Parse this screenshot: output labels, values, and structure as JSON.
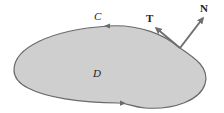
{
  "diagram": {
    "type": "region-with-boundary-curve",
    "labels": {
      "curve": "C",
      "region": "D",
      "tangent": "T",
      "normal": "N"
    },
    "colors": {
      "region_fill": "#cfcfcf",
      "curve_stroke": "#6a6a6a",
      "vector_stroke": "#707070",
      "label_color": "#222222"
    },
    "orientation": "counterclockwise"
  }
}
